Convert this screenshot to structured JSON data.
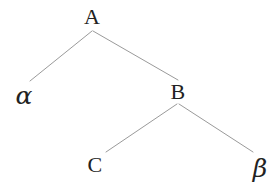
{
  "diagram": {
    "background_color": "#ffffff",
    "edge_color": "#9a9a9a",
    "label_color": "#222222",
    "nodes": [
      {
        "id": "A",
        "label": "A",
        "x": 92,
        "y": 17,
        "style": "upper"
      },
      {
        "id": "alpha",
        "label": "α",
        "x": 24,
        "y": 95,
        "style": "greek"
      },
      {
        "id": "B",
        "label": "B",
        "x": 178,
        "y": 92,
        "style": "upper"
      },
      {
        "id": "C",
        "label": "C",
        "x": 95,
        "y": 165,
        "style": "upper"
      },
      {
        "id": "beta",
        "label": "β",
        "x": 260,
        "y": 168,
        "style": "greek"
      }
    ],
    "edges": [
      {
        "id": "edge-a-alpha",
        "from": "A",
        "to": "alpha",
        "x1": 92,
        "y1": 31,
        "x2": 30,
        "y2": 81
      },
      {
        "id": "edge-a-b",
        "from": "A",
        "to": "B",
        "x1": 93,
        "y1": 31,
        "x2": 178,
        "y2": 80
      },
      {
        "id": "edge-b-c",
        "from": "B",
        "to": "C",
        "x1": 177,
        "y1": 104,
        "x2": 106,
        "y2": 152
      },
      {
        "id": "edge-b-beta",
        "from": "B",
        "to": "beta",
        "x1": 179,
        "y1": 104,
        "x2": 253,
        "y2": 152
      }
    ]
  }
}
